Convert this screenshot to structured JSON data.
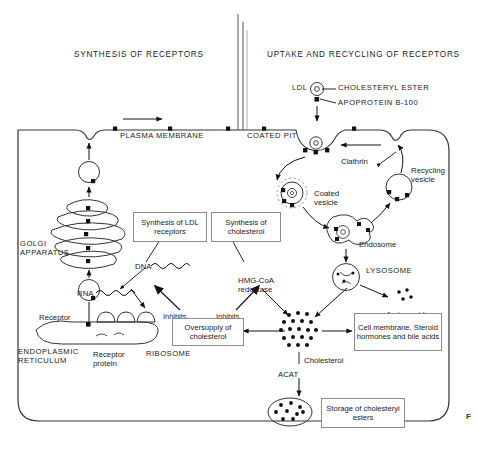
{
  "figure": {
    "marker": "F",
    "headers": {
      "left": "SYNTHESIS OF RECEPTORS",
      "right": "UPTAKE AND RECYCLING OF RECEPTORS"
    }
  },
  "membrane": {
    "label": "PLASMA MEMBRANE",
    "coated_pit": "COATED PIT",
    "clathrin": "Clathrin"
  },
  "ldl": {
    "name": "LDL",
    "cholesteryl_ester": "CHOLESTERYL ESTER",
    "apoprotein": "APOPROTEIN B-100"
  },
  "organelles": {
    "golgi": "GOLGI\nAPPARATUS",
    "er": "ENDOPLASMIC\nRETICULUM",
    "ribosome": "RIBOSOME",
    "receptor": "Receptor",
    "receptor_protein": "Receptor\nprotein",
    "coated_vesicle": "Coated\nvesicle",
    "endosome": "Endosome",
    "recycling_vesicle": "Recycling\nvesicle",
    "lysosome": "LYSOSOME",
    "amino_acids": "Amino acids"
  },
  "genetics": {
    "dna": "DNA",
    "rna": "RNA"
  },
  "boxes": {
    "synthesis_ldl_receptors": "Synthesis of\nLDL receptors",
    "synthesis_cholesterol": "Synthesis of\ncholesterol",
    "oversupply": "Oversupply\nof cholesterol",
    "destinations": "Cell membrane,\nSteroid hormones\nand bile acids",
    "storage": "Storage of\ncholesteryl esters"
  },
  "enzymes": {
    "hmg_coa_reductase": "HMG-CoA\nreductase",
    "acat": "ACAT"
  },
  "regulation": {
    "inhibits_left": "Inhibits",
    "inhibits_right": "Inhibits"
  },
  "metabolites": {
    "cholesterol": "Cholesterol"
  }
}
